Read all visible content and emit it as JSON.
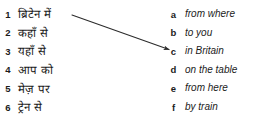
{
  "exercise": {
    "type": "matching-exercise",
    "background_color": "#ffffff",
    "text_color": "#1b1b1b",
    "left_column": {
      "language": "Hindi",
      "items": [
        {
          "marker": "1",
          "text": "ब्रिटेन में"
        },
        {
          "marker": "2",
          "text": "कहाँ से"
        },
        {
          "marker": "3",
          "text": "यहाँ से"
        },
        {
          "marker": "4",
          "text": "आप को"
        },
        {
          "marker": "5",
          "text": "मेज़ पर"
        },
        {
          "marker": "6",
          "text": "ट्रेन से"
        }
      ]
    },
    "right_column": {
      "language": "English",
      "items": [
        {
          "marker": "a",
          "text": "from where"
        },
        {
          "marker": "b",
          "text": "to you"
        },
        {
          "marker": "c",
          "text": "in Britain"
        },
        {
          "marker": "d",
          "text": "on the table"
        },
        {
          "marker": "e",
          "text": "from here"
        },
        {
          "marker": "f",
          "text": "by train"
        }
      ]
    },
    "connections": [
      {
        "from_marker": "1",
        "to_marker": "c",
        "from_x": 72,
        "from_y": 15,
        "to_x": 170,
        "to_y": 50,
        "color": "#2b2b2b"
      }
    ]
  }
}
